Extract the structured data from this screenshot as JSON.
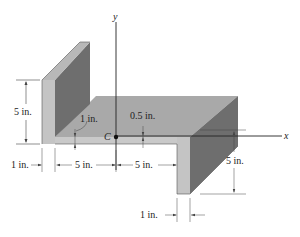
{
  "diagram": {
    "type": "Z-section cross-section (isometric)",
    "axes": {
      "y_label": "y",
      "x_label": "x"
    },
    "centroid_label": "C",
    "dimensions": {
      "left_flange_height": "5 in.",
      "web_thickness": "1 in.",
      "centroid_offset": "0.5 in.",
      "left_flange_thickness": "1 in.",
      "web_left_length": "5 in.",
      "web_right_length": "5 in.",
      "right_flange_height": "5 in.",
      "right_flange_thickness": "1 in."
    },
    "colors": {
      "top_face": "#a9a9a9",
      "front_face": "#c4c4c4",
      "dark_face": "#6e6e6e",
      "line": "#333333"
    }
  }
}
